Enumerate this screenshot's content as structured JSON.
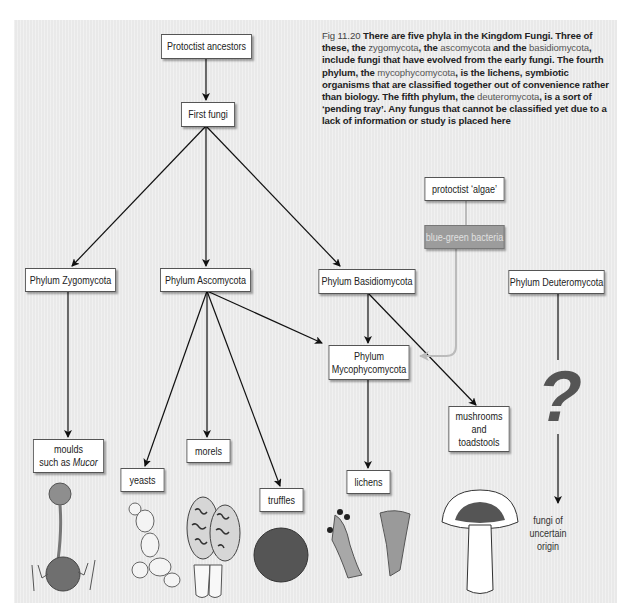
{
  "caption": {
    "figure_label": "Fig 11.20",
    "segments": [
      {
        "text": " There are five phyla in the Kingdom Fungi. Three of these, the ",
        "style": "bold"
      },
      {
        "text": "zygomycota",
        "style": "plain"
      },
      {
        "text": ", the ",
        "style": "bold"
      },
      {
        "text": "ascomycota",
        "style": "plain"
      },
      {
        "text": " and the ",
        "style": "bold"
      },
      {
        "text": "basidiomycota",
        "style": "plain"
      },
      {
        "text": ", include fungi that have evolved from the early fungi. The fourth phylum, the ",
        "style": "bold"
      },
      {
        "text": "mycophycomycota",
        "style": "plain"
      },
      {
        "text": ", is the lichens, symbiotic organisms that are classified together out of convenience rather than biology. The fifth phylum, the ",
        "style": "bold"
      },
      {
        "text": "deuteromycota",
        "style": "plain"
      },
      {
        "text": ", is a sort of ‘pending tray’. Any fungus that cannot be classified yet due to a lack of information or study is placed here",
        "style": "bold"
      }
    ]
  },
  "nodes": {
    "protoctist_ancestors": "Protoctist ancestors",
    "first_fungi": "First fungi",
    "zygomycota": "Phylum Zygomycota",
    "ascomycota": "Phylum Ascomycota",
    "basidiomycota": "Phylum Basidiomycota",
    "deuteromycota": "Phylum Deuteromycota",
    "protoctist_algae": "protoctist ‘algae’",
    "blue_green_bacteria": "blue-green bacteria",
    "mycophycomycota_line1": "Phylum",
    "mycophycomycota_line2": "Mycophycomycota",
    "moulds_line1": "moulds",
    "moulds_line2_prefix": "such as ",
    "moulds_line2_italic": "Mucor",
    "yeasts": "yeasts",
    "morels": "morels",
    "truffles": "truffles",
    "lichens": "lichens",
    "mushrooms_line1": "mushrooms",
    "mushrooms_line2": "and",
    "mushrooms_line3": "toadstools"
  },
  "deuteromycota_symbol": "?",
  "uncertain_note": {
    "line1": "fungi of",
    "line2": "uncertain",
    "line3": "origin"
  },
  "colors": {
    "panel_bg": "#e9e9e9",
    "bacteria_box": "#9c9c9c",
    "symbiosis_arrow": "#b8b8b8",
    "question_mark": "#555555"
  }
}
